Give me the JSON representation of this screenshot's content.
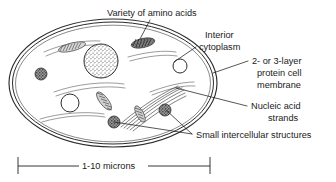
{
  "figure": {
    "title_present": false,
    "type": "biological-cell-diagram",
    "colors": {
      "ink": "#1f1f1f",
      "membrane": "#2b2b2b",
      "background": "#ffffff",
      "strand": "#4a4a4a"
    }
  },
  "labels": {
    "amino_acids": "Variety of amino acids",
    "interior_line1": "Interior",
    "interior_line2": "cytoplasm",
    "membrane_line1": "2- or 3-layer",
    "membrane_line2": "protein cell",
    "membrane_line3": "membrane",
    "nucleic_line1": "Nucleic acid",
    "nucleic_line2": "strands",
    "small_structures": "Small intercellular structures"
  },
  "scale_bar": {
    "caption": "1-10  microns",
    "value_range": "1-10",
    "unit": "microns"
  },
  "structures": {
    "nucleoid": {
      "name": "stippled-nucleoid",
      "cx": 101,
      "cy": 61,
      "r": 17
    },
    "vacuoles": [
      {
        "name": "open-vacuole-left",
        "cx": 70,
        "cy": 103,
        "r": 9
      },
      {
        "name": "open-vacuole-right",
        "cx": 180,
        "cy": 66,
        "r": 7
      }
    ],
    "granules": [
      {
        "name": "granule-far-left",
        "cx": 41,
        "cy": 74,
        "r": 6
      },
      {
        "name": "granule-lower-center",
        "cx": 114,
        "cy": 122,
        "r": 6
      },
      {
        "name": "granule-lower-right",
        "cx": 165,
        "cy": 110,
        "r": 6
      },
      {
        "name": "granule-top-center",
        "cx": 143,
        "cy": 43,
        "r": 6
      }
    ]
  }
}
